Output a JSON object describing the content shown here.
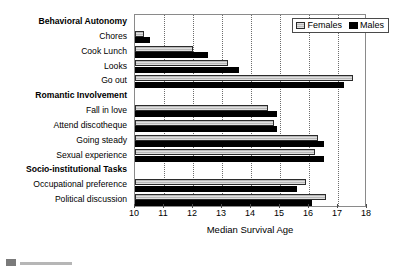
{
  "chart_data": {
    "type": "bar",
    "orientation": "horizontal",
    "title": "",
    "xlabel": "Median Survival Age",
    "ylabel": "",
    "xlim": [
      10,
      18
    ],
    "xticks": [
      10,
      11,
      12,
      13,
      14,
      15,
      16,
      17,
      18
    ],
    "grid": true,
    "grid_axis": "x",
    "legend": {
      "position": "top-right",
      "entries": [
        {
          "name": "Females",
          "color": "#b9b9b9"
        },
        {
          "name": "Males",
          "color": "#000000"
        }
      ]
    },
    "categories": [
      "Behavioral Autonomy",
      "Chores",
      "Cook Lunch",
      "Looks",
      "Go out",
      "Romantic Involvement",
      "Fall in love",
      "Attend discotheque",
      "Going steady",
      "Sexual experience",
      "Socio-institutional Tasks",
      "Occupational preference",
      "Political discussion"
    ],
    "category_is_header": [
      true,
      false,
      false,
      false,
      false,
      true,
      false,
      false,
      false,
      false,
      true,
      false,
      false
    ],
    "series": [
      {
        "name": "Females",
        "values": [
          null,
          10.3,
          12.0,
          13.2,
          17.5,
          null,
          14.6,
          14.8,
          16.3,
          16.2,
          null,
          15.9,
          16.6
        ]
      },
      {
        "name": "Males",
        "values": [
          null,
          10.5,
          12.5,
          13.6,
          17.2,
          null,
          14.9,
          14.9,
          16.5,
          16.5,
          null,
          15.6,
          16.1
        ]
      }
    ]
  },
  "legend": {
    "females": "Females",
    "males": "Males"
  },
  "axis": {
    "xlabel": "Median Survival Age",
    "tick_10": "10",
    "tick_11": "11",
    "tick_12": "12",
    "tick_13": "13",
    "tick_14": "14",
    "tick_15": "15",
    "tick_16": "16",
    "tick_17": "17",
    "tick_18": "18"
  },
  "labels": {
    "behavioral_autonomy": "Behavioral Autonomy",
    "chores": "Chores",
    "cook_lunch": "Cook Lunch",
    "looks": "Looks",
    "go_out": "Go out",
    "romantic_involvement": "Romantic Involvement",
    "fall_in_love": "Fall in love",
    "attend_discotheque": "Attend discotheque",
    "going_steady": "Going steady",
    "sexual_experience": "Sexual experience",
    "socio_institutional_tasks": "Socio-institutional Tasks",
    "occupational_preference": "Occupational preference",
    "political_discussion": "Political discussion"
  }
}
